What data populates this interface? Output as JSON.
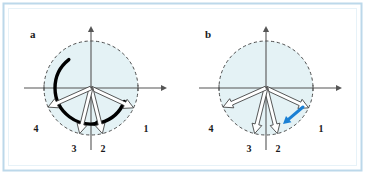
{
  "figure": {
    "background_color": "#ffffff",
    "frame_border_color": "#bcd8ea",
    "frame_inner_color": "#f2f9fc",
    "disk_fill_color": "#e4f2f5",
    "disk_edge_color": "#3b3b3b",
    "axis_color": "#555555",
    "vector_outline_color": "#3a3a3a",
    "vector_fill_color": "#ffffff",
    "sweep_arc_color": "#000000",
    "highlight_arrow_color": "#1b80d4"
  },
  "panels": [
    {
      "id": "panel-a",
      "letter": "a",
      "center": {
        "x": 91,
        "y": 88
      },
      "disk_radius": 47,
      "axis": {
        "x_min": 24,
        "x_max": 166,
        "y_min": 27,
        "y_max": 150,
        "tick_left_x": 44,
        "tick_right_x": 138
      },
      "vectors": [
        {
          "label": "1",
          "angle_deg": -25,
          "label_x": 146,
          "label_y": 132
        },
        {
          "label": "2",
          "angle_deg": -76,
          "label_x": 103,
          "label_y": 152
        },
        {
          "label": "3",
          "angle_deg": -104,
          "label_x": 74,
          "label_y": 152
        },
        {
          "label": "4",
          "angle_deg": -156,
          "label_x": 36,
          "label_y": 132
        }
      ],
      "sweep_arc": {
        "present": true,
        "radius": 36,
        "start_angle_deg": -22,
        "end_angle_deg": -232,
        "direction": "counterclockwise-drawn-clockwise-head",
        "stroke_width": 3.4,
        "arrowhead_angle_deg": -76
      },
      "highlight_arrow": {
        "present": false
      }
    },
    {
      "id": "panel-b",
      "letter": "b",
      "center": {
        "x": 266,
        "y": 88
      },
      "disk_radius": 47,
      "axis": {
        "x_min": 199,
        "x_max": 341,
        "y_min": 27,
        "y_max": 150,
        "tick_left_x": 219,
        "tick_right_x": 313
      },
      "vectors": [
        {
          "label": "1",
          "angle_deg": -25,
          "label_x": 321,
          "label_y": 132
        },
        {
          "label": "2",
          "angle_deg": -76,
          "label_x": 278,
          "label_y": 152
        },
        {
          "label": "3",
          "angle_deg": -104,
          "label_x": 249,
          "label_y": 152
        },
        {
          "label": "4",
          "angle_deg": -156,
          "label_x": 211,
          "label_y": 132
        }
      ],
      "sweep_arc": {
        "present": false
      },
      "highlight_arrow": {
        "present": true,
        "from_x": 303,
        "from_y": 107,
        "to_x": 283,
        "to_y": 124,
        "color": "#1b80d4",
        "stroke_width": 3
      }
    }
  ],
  "chart_data": {
    "type": "scatter",
    "xlabel": "",
    "ylabel": "",
    "subplots": [
      {
        "label": "a",
        "description": "Unit disk with four numbered vectors and a thick black circular sweep arrow indicating rotation",
        "vector_angles_deg": [
          -25,
          -76,
          -104,
          -156
        ],
        "vector_labels": [
          "1",
          "2",
          "3",
          "4"
        ],
        "sweep_arc_span_deg": 210
      },
      {
        "label": "b",
        "description": "Unit disk with the same four numbered vectors and a short blue arrow between vector 1 and vector 2",
        "vector_angles_deg": [
          -25,
          -76,
          -104,
          -156
        ],
        "vector_labels": [
          "1",
          "2",
          "3",
          "4"
        ],
        "highlight_arrow_from_vector": "1",
        "highlight_arrow_to_vector": "2"
      }
    ]
  }
}
